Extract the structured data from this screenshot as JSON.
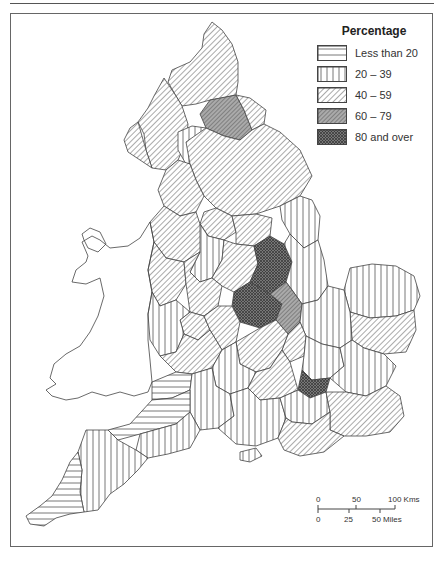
{
  "legend": {
    "title": "Percentage",
    "items": [
      {
        "label": "Less than 20",
        "pattern": "horizontal-lines"
      },
      {
        "label": "20 – 39",
        "pattern": "vertical-lines"
      },
      {
        "label": "40 – 59",
        "pattern": "diagonal-lines"
      },
      {
        "label": "60 – 79",
        "pattern": "dense-diagonal"
      },
      {
        "label": "80 and over",
        "pattern": "crosshatch-dark"
      }
    ]
  },
  "scale_bar": {
    "km_ticks": [
      "0",
      "50",
      "100 Kms"
    ],
    "mile_ticks": [
      "0",
      "25",
      "50 Miles"
    ]
  },
  "colors": {
    "line": "#444444",
    "band_60_79": "#8a8a8a",
    "band_80_plus": "#555555"
  }
}
